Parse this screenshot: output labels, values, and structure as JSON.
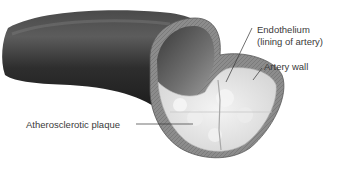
{
  "diagram": {
    "type": "anatomical illustration",
    "labels": {
      "endothelium_line1": "Endothelium",
      "endothelium_line2": "(lining of artery)",
      "artery_wall": "Artery wall",
      "plaque": "Atherosclerotic plaque"
    },
    "colors": {
      "artery_exterior": "#2a2a2a",
      "artery_wall": "#8a8a8a",
      "lumen": "#5a5a5a",
      "plaque": "#e8e8e8",
      "leader_line": "#333333",
      "text": "#3a3a3a"
    }
  }
}
